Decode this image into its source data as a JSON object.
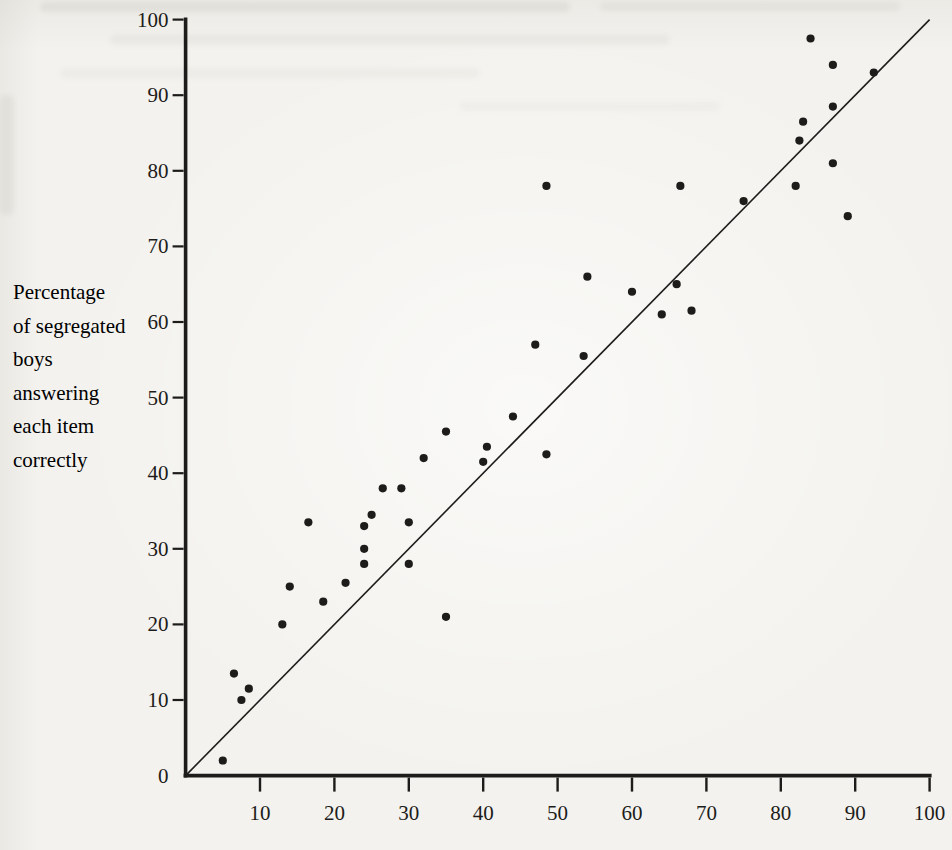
{
  "page": {
    "background_color": "#f3f2ee",
    "ink_color": "#1d1c1a"
  },
  "chart_data": {
    "type": "scatter",
    "title": "",
    "xlabel": "",
    "ylabel": "Percentage\nof segregated\nboys\nanswering\neach item\ncorrectly",
    "xlim": [
      0,
      100
    ],
    "ylim": [
      0,
      100
    ],
    "x_ticks": [
      10,
      20,
      30,
      40,
      50,
      60,
      70,
      80,
      90,
      100
    ],
    "y_ticks": [
      0,
      10,
      20,
      30,
      40,
      50,
      60,
      70,
      80,
      90,
      100
    ],
    "grid": false,
    "legend": false,
    "reference_line": {
      "x1": 0,
      "y1": 0,
      "x2": 100,
      "y2": 100,
      "description": "identity line y = x"
    },
    "marker": {
      "shape": "circle",
      "radius_px": 4.1
    },
    "points": [
      [
        5,
        2
      ],
      [
        6.5,
        13.5
      ],
      [
        7.5,
        10
      ],
      [
        8.5,
        11.5
      ],
      [
        13,
        20
      ],
      [
        14,
        25
      ],
      [
        16.5,
        33.5
      ],
      [
        18.5,
        23
      ],
      [
        21.5,
        25.5
      ],
      [
        24,
        28
      ],
      [
        24,
        30
      ],
      [
        24,
        33
      ],
      [
        25,
        34.5
      ],
      [
        26.5,
        38
      ],
      [
        29,
        38
      ],
      [
        30,
        28
      ],
      [
        30,
        33.5
      ],
      [
        32,
        42
      ],
      [
        35,
        21
      ],
      [
        35,
        45.5
      ],
      [
        40,
        41.5
      ],
      [
        40.5,
        43.5
      ],
      [
        44,
        47.5
      ],
      [
        47,
        57
      ],
      [
        48.5,
        42.5
      ],
      [
        48.5,
        78
      ],
      [
        53.5,
        55.5
      ],
      [
        54,
        66
      ],
      [
        60,
        64
      ],
      [
        64,
        61
      ],
      [
        66,
        65
      ],
      [
        66.5,
        78
      ],
      [
        68,
        61.5
      ],
      [
        75,
        76
      ],
      [
        82,
        78
      ],
      [
        82.5,
        84
      ],
      [
        83,
        86.5
      ],
      [
        84,
        97.5
      ],
      [
        87,
        81
      ],
      [
        87,
        88.5
      ],
      [
        87,
        94
      ],
      [
        89,
        74
      ],
      [
        92.5,
        93
      ]
    ]
  }
}
